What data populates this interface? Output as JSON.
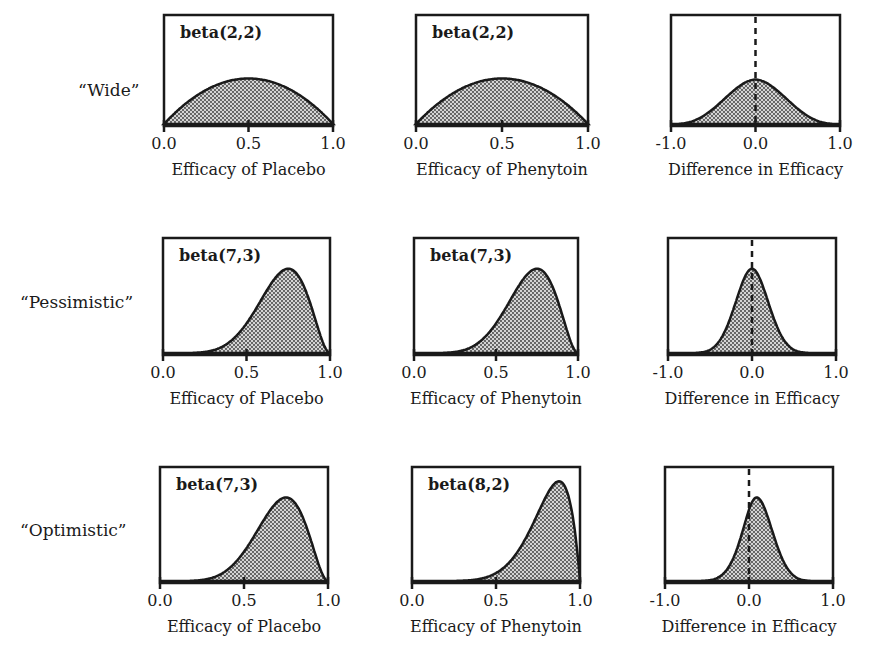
{
  "rows": [
    {
      "label": "“Wide”"
    },
    {
      "label": "“Pessimistic”"
    },
    {
      "label": "“Optimistic”"
    }
  ],
  "panels": [
    {
      "row": 0,
      "col": 0,
      "dist": "beta(2,2)",
      "xlabel": "Efficacy of Placebo",
      "ticks": [
        "0.0",
        "0.5",
        "1.0"
      ]
    },
    {
      "row": 0,
      "col": 1,
      "dist": "beta(2,2)",
      "xlabel": "Efficacy of Phenytoin",
      "ticks": [
        "0.0",
        "0.5",
        "1.0"
      ]
    },
    {
      "row": 0,
      "col": 2,
      "dist": "",
      "xlabel": "Difference in Efficacy",
      "ticks": [
        "-1.0",
        "0.0",
        "1.0"
      ]
    },
    {
      "row": 1,
      "col": 0,
      "dist": "beta(7,3)",
      "xlabel": "Efficacy of Placebo",
      "ticks": [
        "0.0",
        "0.5",
        "1.0"
      ]
    },
    {
      "row": 1,
      "col": 1,
      "dist": "beta(7,3)",
      "xlabel": "Efficacy of Phenytoin",
      "ticks": [
        "0.0",
        "0.5",
        "1.0"
      ]
    },
    {
      "row": 1,
      "col": 2,
      "dist": "",
      "xlabel": "Difference in Efficacy",
      "ticks": [
        "-1.0",
        "0.0",
        "1.0"
      ]
    },
    {
      "row": 2,
      "col": 0,
      "dist": "beta(7,3)",
      "xlabel": "Efficacy of Placebo",
      "ticks": [
        "0.0",
        "0.5",
        "1.0"
      ]
    },
    {
      "row": 2,
      "col": 1,
      "dist": "beta(8,2)",
      "xlabel": "Efficacy of Phenytoin",
      "ticks": [
        "0.0",
        "0.5",
        "1.0"
      ]
    },
    {
      "row": 2,
      "col": 2,
      "dist": "",
      "xlabel": "Difference in Efficacy",
      "ticks": [
        "-1.0",
        "0.0",
        "1.0"
      ]
    }
  ],
  "chart_data": [
    {
      "type": "area",
      "title": "“Wide” prior - Placebo",
      "annotation": "beta(2,2)",
      "distribution": {
        "family": "beta",
        "a": 2,
        "b": 2
      },
      "xlabel": "Efficacy of Placebo",
      "ylabel": "",
      "xlim": [
        0,
        1
      ],
      "xticks": [
        0.0,
        0.5,
        1.0
      ],
      "fill": "stippled"
    },
    {
      "type": "area",
      "title": "“Wide” prior - Phenytoin",
      "annotation": "beta(2,2)",
      "distribution": {
        "family": "beta",
        "a": 2,
        "b": 2
      },
      "xlabel": "Efficacy of Phenytoin",
      "ylabel": "",
      "xlim": [
        0,
        1
      ],
      "xticks": [
        0.0,
        0.5,
        1.0
      ],
      "fill": "stippled"
    },
    {
      "type": "area",
      "title": "“Wide” prior - Difference",
      "annotation": "",
      "distribution": {
        "family": "difference",
        "of": [
          "beta(2,2)",
          "beta(2,2)"
        ],
        "center": 0.0
      },
      "xlabel": "Difference in Efficacy",
      "ylabel": "",
      "xlim": [
        -1,
        1
      ],
      "xticks": [
        -1.0,
        0.0,
        1.0
      ],
      "reference_line": {
        "x": 0.0,
        "style": "dashed"
      },
      "fill": "stippled"
    },
    {
      "type": "area",
      "title": "“Pessimistic” prior - Placebo",
      "annotation": "beta(7,3)",
      "distribution": {
        "family": "beta",
        "a": 7,
        "b": 3
      },
      "xlabel": "Efficacy of Placebo",
      "ylabel": "",
      "xlim": [
        0,
        1
      ],
      "xticks": [
        0.0,
        0.5,
        1.0
      ],
      "fill": "stippled"
    },
    {
      "type": "area",
      "title": "“Pessimistic” prior - Phenytoin",
      "annotation": "beta(7,3)",
      "distribution": {
        "family": "beta",
        "a": 7,
        "b": 3
      },
      "xlabel": "Efficacy of Phenytoin",
      "ylabel": "",
      "xlim": [
        0,
        1
      ],
      "xticks": [
        0.0,
        0.5,
        1.0
      ],
      "fill": "stippled"
    },
    {
      "type": "area",
      "title": "“Pessimistic” prior - Difference",
      "annotation": "",
      "distribution": {
        "family": "difference",
        "of": [
          "beta(7,3)",
          "beta(7,3)"
        ],
        "center": 0.0
      },
      "xlabel": "Difference in Efficacy",
      "ylabel": "",
      "xlim": [
        -1,
        1
      ],
      "xticks": [
        -1.0,
        0.0,
        1.0
      ],
      "reference_line": {
        "x": 0.0,
        "style": "dashed"
      },
      "fill": "stippled"
    },
    {
      "type": "area",
      "title": "“Optimistic” prior - Placebo",
      "annotation": "beta(7,3)",
      "distribution": {
        "family": "beta",
        "a": 7,
        "b": 3
      },
      "xlabel": "Efficacy of Placebo",
      "ylabel": "",
      "xlim": [
        0,
        1
      ],
      "xticks": [
        0.0,
        0.5,
        1.0
      ],
      "fill": "stippled"
    },
    {
      "type": "area",
      "title": "“Optimistic” prior - Phenytoin",
      "annotation": "beta(8,2)",
      "distribution": {
        "family": "beta",
        "a": 8,
        "b": 2
      },
      "xlabel": "Efficacy of Phenytoin",
      "ylabel": "",
      "xlim": [
        0,
        1
      ],
      "xticks": [
        0.0,
        0.5,
        1.0
      ],
      "fill": "stippled"
    },
    {
      "type": "area",
      "title": "“Optimistic” prior - Difference",
      "annotation": "",
      "distribution": {
        "family": "difference",
        "of": [
          "beta(8,2)",
          "beta(7,3)"
        ],
        "center": 0.1
      },
      "xlabel": "Difference in Efficacy",
      "ylabel": "",
      "xlim": [
        -1,
        1
      ],
      "xticks": [
        -1.0,
        0.0,
        1.0
      ],
      "reference_line": {
        "x": 0.0,
        "style": "dashed"
      },
      "fill": "stippled"
    }
  ]
}
